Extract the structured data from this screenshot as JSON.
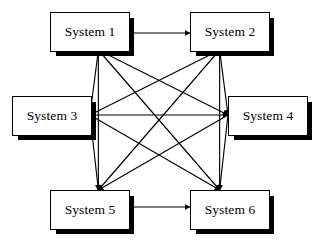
{
  "diagram": {
    "type": "node-link-mesh",
    "background_color": "#ffffff",
    "line_color": "#000000",
    "box_fill_color": "#ffffff",
    "box_border_color": "#000000",
    "shadow_color": "#000000",
    "nodes": [
      {
        "id": "system-1",
        "label": "System 1",
        "x": 50,
        "y": 12,
        "w": 78,
        "h": 38
      },
      {
        "id": "system-2",
        "label": "System 2",
        "x": 190,
        "y": 12,
        "w": 78,
        "h": 38
      },
      {
        "id": "system-3",
        "label": "System 3",
        "x": 12,
        "y": 96,
        "w": 78,
        "h": 38
      },
      {
        "id": "system-4",
        "label": "System 4",
        "x": 228,
        "y": 96,
        "w": 78,
        "h": 38
      },
      {
        "id": "system-5",
        "label": "System 5",
        "x": 50,
        "y": 190,
        "w": 78,
        "h": 38
      },
      {
        "id": "system-6",
        "label": "System 6",
        "x": 190,
        "y": 190,
        "w": 78,
        "h": 38
      }
    ],
    "edges": [
      {
        "from": "system-1",
        "to": "system-2"
      },
      {
        "from": "system-1",
        "to": "system-3"
      },
      {
        "from": "system-1",
        "to": "system-4"
      },
      {
        "from": "system-1",
        "to": "system-5"
      },
      {
        "from": "system-1",
        "to": "system-6"
      },
      {
        "from": "system-2",
        "to": "system-3"
      },
      {
        "from": "system-2",
        "to": "system-4"
      },
      {
        "from": "system-2",
        "to": "system-5"
      },
      {
        "from": "system-2",
        "to": "system-6"
      },
      {
        "from": "system-3",
        "to": "system-4"
      },
      {
        "from": "system-3",
        "to": "system-5"
      },
      {
        "from": "system-3",
        "to": "system-6"
      },
      {
        "from": "system-4",
        "to": "system-5"
      },
      {
        "from": "system-4",
        "to": "system-6"
      },
      {
        "from": "system-5",
        "to": "system-6"
      }
    ],
    "edge_count": 15,
    "node_count": 6
  }
}
